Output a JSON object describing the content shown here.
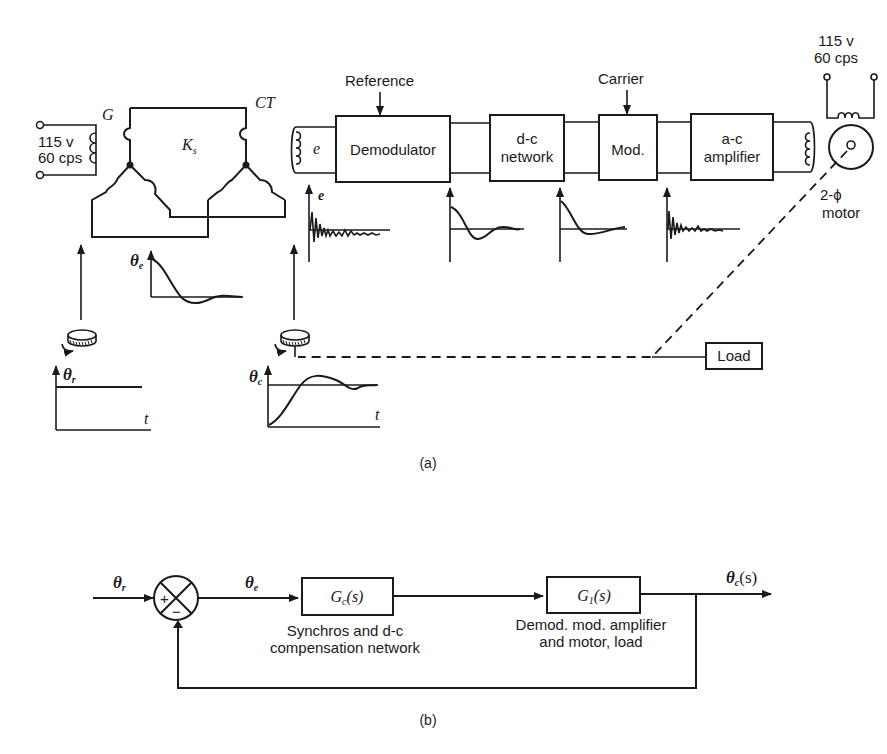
{
  "figure_a": {
    "caption": "(a)",
    "source_left": {
      "voltage": "115 v",
      "frequency": "60 cps"
    },
    "source_right": {
      "voltage": "115 v",
      "frequency": "60 cps"
    },
    "generator_label": "G",
    "control_transformer_label": "CT",
    "gain_label": "K",
    "gain_sub": "s",
    "error_voltage_label": "e",
    "reference_label": "Reference",
    "carrier_label": "Carrier",
    "blocks": [
      {
        "line1": "Demodulator",
        "line2": ""
      },
      {
        "line1": "d-c",
        "line2": "network"
      },
      {
        "line1": "Mod.",
        "line2": ""
      },
      {
        "line1": "a-c",
        "line2": "amplifier"
      }
    ],
    "motor_label_1": "2-ϕ",
    "motor_label_2": "motor",
    "load_label": "Load",
    "plot_labels": {
      "theta_e": "θ",
      "theta_e_sub": "e",
      "theta_r": "θ",
      "theta_r_sub": "r",
      "theta_c": "θ",
      "theta_c_sub": "c",
      "t": "t",
      "e": "e"
    }
  },
  "figure_b": {
    "caption": "(b)",
    "input_label": "θ",
    "input_sub": "r",
    "error_label": "θ",
    "error_sub": "e",
    "output_label": "θ",
    "output_sub": "c",
    "output_suffix": "(s)",
    "summing_plus": "+",
    "summing_minus": "−",
    "block1": {
      "label": "G",
      "sub": "c",
      "suffix": "(s)",
      "desc1": "Synchros and d-c",
      "desc2": "compensation network"
    },
    "block2": {
      "label": "G",
      "sub": "1",
      "suffix": "(s)",
      "desc1": "Demod. mod. amplifier",
      "desc2": "and motor, load"
    }
  }
}
